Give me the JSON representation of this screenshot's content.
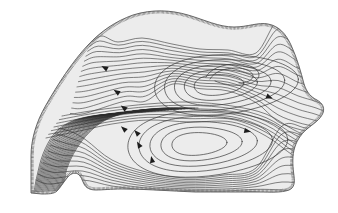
{
  "figure": {
    "title": "",
    "type": "streamline-contour-map",
    "width": 338,
    "height": 213
  },
  "colors": {
    "background": "#ffffff",
    "domain_fill": "#ececec",
    "domain_outline": "#5a5a5a",
    "hatch": "#6e6e6e",
    "streamline": "#3a3a3a",
    "streamline_dense": "#2e2e2e",
    "contour": "#333333",
    "arrow": "#1c1c1c"
  },
  "chart_data": {
    "type": "line",
    "title": "",
    "subtitle": "",
    "xlabel": "",
    "ylabel": "",
    "xlim": [
      0,
      338
    ],
    "ylim": [
      0,
      213
    ],
    "grid": false,
    "legend": null,
    "tick_labels": {
      "x": [],
      "y": []
    },
    "annotations": [],
    "domain_boundary": {
      "name": "hatched-basin-boundary",
      "hatch_side": "outside",
      "path": "M 31,193 L 31,156 C 31,140 36,122 46,105 C 58,84 72,62 88,45 C 101,31 116,21 133,15 C 152,9 171,10 188,15 C 205,20 219,27 234,27 C 248,27 258,22 268,24 C 279,26 286,34 291,45 C 297,58 301,72 304,84 C 307,93 311,97 317,100 C 322,103 325,107 323,113 C 320,120 313,124 307,129 C 300,135 296,142 294,150 C 292,159 293,168 294,176 C 295,183 294,188 289,190 C 281,193 270,192 259,192 C 237,192 216,192 195,192 C 170,191 146,189 122,189 C 110,189 103,190 96,190 C 90,190 86,188 84,184 C 82,180 81,176 78,174 C 74,172 70,174 67,178 C 63,183 60,188 57,191 C 54,194 48,194 42,194 Z"
    },
    "recirculation_cells": [
      {
        "name": "upper-cell",
        "center": [
          215,
          85
        ],
        "rotation": "clockwise",
        "contour_levels": 5,
        "outer_path": "M 138,86 C 145,72 163,63 186,61 C 213,59 240,63 258,71 C 272,77 281,86 281,95 C 281,104 272,111 258,115 C 240,120 215,122 192,120 C 168,118 150,111 142,101 C 137,95 136,90 138,86 Z"
      },
      {
        "name": "upper-cell-inner-hook",
        "center": [
          234,
          74
        ],
        "rotation": "clockwise",
        "contour_levels": 1,
        "outer_path": "M 206,77 C 210,69 222,64 237,64 C 250,64 259,69 259,75 C 259,80 252,84 242,85 C 232,86 222,84 215,81"
      },
      {
        "name": "lower-cell",
        "center": [
          195,
          144
        ],
        "rotation": "clockwise",
        "contour_levels": 5,
        "outer_path": "M 121,141 C 125,128 140,119 163,116 C 192,113 226,117 250,127 C 268,134 279,144 279,153 C 279,163 267,170 249,174 C 226,179 196,180 170,176 C 145,172 128,163 122,152 C 119,147 119,144 121,141 Z"
      }
    ],
    "dense_streamline_bundle": {
      "name": "western-boundary-current",
      "region": "lower-left",
      "line_count": 26,
      "note": "tightly packed near-parallel streamlines converging toward bottom-left corner"
    },
    "flow_direction_arrows": [
      {
        "x": 105,
        "y": 68,
        "angle": 208,
        "label": "arrow-nw-1"
      },
      {
        "x": 117,
        "y": 92,
        "angle": 213,
        "label": "arrow-nw-2"
      },
      {
        "x": 124,
        "y": 108,
        "angle": 218,
        "label": "arrow-nw-3"
      },
      {
        "x": 124,
        "y": 129,
        "angle": 222,
        "label": "arrow-nw-4"
      },
      {
        "x": 137,
        "y": 133,
        "angle": 228,
        "label": "arrow-lower-1"
      },
      {
        "x": 139,
        "y": 145,
        "angle": 240,
        "label": "arrow-lower-2"
      },
      {
        "x": 152,
        "y": 160,
        "angle": 258,
        "label": "arrow-lower-3"
      },
      {
        "x": 269,
        "y": 97,
        "angle": 22,
        "label": "arrow-east-1"
      },
      {
        "x": 247,
        "y": 131,
        "angle": 12,
        "label": "arrow-east-2"
      }
    ],
    "series": [
      {
        "name": "streamline-bundle-upper",
        "values": [],
        "note": "contours emanating from NW boundary sweeping east around upper cell"
      },
      {
        "name": "streamline-bundle-lower",
        "values": [],
        "note": "contours sweeping east around lower cell toward SE boundary"
      }
    ]
  }
}
